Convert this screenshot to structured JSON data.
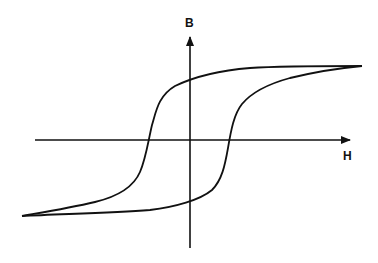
{
  "diagram": {
    "type": "hysteresis-loop",
    "axes": {
      "vertical_label": "B",
      "horizontal_label": "H"
    },
    "colors": {
      "stroke": "#111111",
      "background": "#ffffff"
    }
  }
}
